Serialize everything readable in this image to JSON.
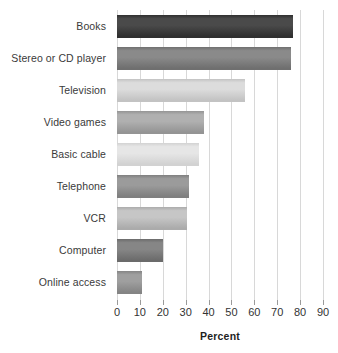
{
  "chart_data": {
    "type": "bar",
    "orientation": "horizontal",
    "title": "",
    "xlabel": "Percent",
    "ylabel": "",
    "xlim": [
      0,
      90
    ],
    "xticks": [
      0,
      10,
      20,
      30,
      40,
      50,
      60,
      70,
      80,
      90
    ],
    "xtick_labels": [
      "0",
      "10",
      "20",
      "30",
      "40",
      "50",
      "60",
      "70",
      "80",
      "90"
    ],
    "grid": true,
    "legend": false,
    "categories": [
      "Books",
      "Stereo or CD player",
      "Television",
      "Video games",
      "Basic cable",
      "Telephone",
      "VCR",
      "Computer",
      "Online access"
    ],
    "values": [
      77,
      76,
      56,
      38,
      36,
      31.5,
      30.5,
      20,
      11
    ],
    "bar_colors": [
      "#4a4a4a",
      "#8a8a8a",
      "#dcdcdc",
      "#b0b0b0",
      "#e6e6e6",
      "#9b9b9b",
      "#c6c6c6",
      "#868686",
      "#9f9f9f"
    ],
    "bar_edge_colors": [
      "#2f2f2f",
      "#6f6f6f",
      "#c3c3c3",
      "#949494",
      "#d2d2d2",
      "#7f7f7f",
      "#ababab",
      "#6b6b6b",
      "#848484"
    ],
    "gridline_color": "#d8d8d8",
    "axis_text_color": "#333333"
  }
}
